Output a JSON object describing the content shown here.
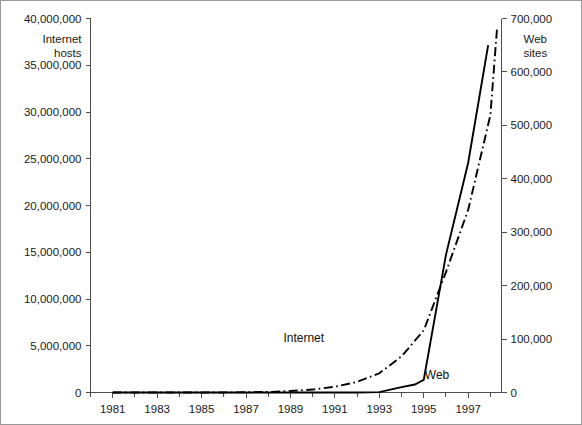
{
  "chart_data": {
    "type": "line",
    "title": "",
    "subtitle": "",
    "xlabel": "",
    "ylabel": "Internet hosts",
    "y2label": "Web sites",
    "ylabel_line1": "Internet",
    "ylabel_line2": "hosts",
    "y2label_line1": "Web",
    "y2label_line2": "sites",
    "grid": false,
    "legend_position": "inline-annotation",
    "xlim": [
      1980.0,
      1998.5
    ],
    "ylim": [
      0,
      40000000
    ],
    "y2lim": [
      0,
      700000
    ],
    "x_tick_labels": [
      "1981",
      "1983",
      "1985",
      "1987",
      "1989",
      "1991",
      "1993",
      "1995",
      "1997"
    ],
    "x_tick_values": [
      1981,
      1983,
      1985,
      1987,
      1989,
      1991,
      1993,
      1995,
      1997
    ],
    "x_minor_ticks": [
      1980,
      1982,
      1984,
      1986,
      1988,
      1990,
      1992,
      1994,
      1996,
      1998
    ],
    "y_tick_labels": [
      "0",
      "5,000,000",
      "10,000,000",
      "15,000,000",
      "20,000,000",
      "25,000,000",
      "30,000,000",
      "35,000,000",
      "40,000,000"
    ],
    "y_tick_values": [
      0,
      5000000,
      10000000,
      15000000,
      20000000,
      25000000,
      30000000,
      35000000,
      40000000
    ],
    "y2_tick_labels": [
      "0",
      "100,000",
      "200,000",
      "300,000",
      "400,000",
      "500,000",
      "600,000",
      "700,000"
    ],
    "y2_tick_values": [
      0,
      100000,
      200000,
      300000,
      400000,
      500000,
      600000,
      700000
    ],
    "series": [
      {
        "name": "Internet",
        "axis": "left",
        "style": "dash-dot",
        "color": "#000000",
        "label_x": 1989.6,
        "label_y_value": 5400000,
        "x": [
          1981,
          1982,
          1983,
          1984,
          1985,
          1986,
          1987,
          1988,
          1989,
          1990,
          1991,
          1992,
          1993,
          1994,
          1995,
          1996,
          1997,
          1998,
          1998.3
        ],
        "values": [
          213,
          235,
          562,
          1024,
          1961,
          5089,
          28174,
          56000,
          159000,
          313000,
          617000,
          1136000,
          2056000,
          3864000,
          6642000,
          12881000,
          19540000,
          29670000,
          39000000
        ]
      },
      {
        "name": "Web",
        "axis": "right",
        "style": "solid",
        "color": "#000000",
        "label_x": 1995.6,
        "label_y_value": 25000,
        "x": [
          1981,
          1990,
          1992,
          1993,
          1994,
          1994.6,
          1995,
          1996,
          1997,
          1997.9
        ],
        "values": [
          0,
          0,
          50,
          623,
          10022,
          15000,
          23500,
          257601,
          430000,
          650000
        ]
      }
    ],
    "crossover_note": "Series cross near 1996"
  },
  "axis_labels": {
    "left_title_line1": "Internet",
    "left_title_line2": "hosts",
    "right_title_line1": "Web",
    "right_title_line2": "sites"
  }
}
